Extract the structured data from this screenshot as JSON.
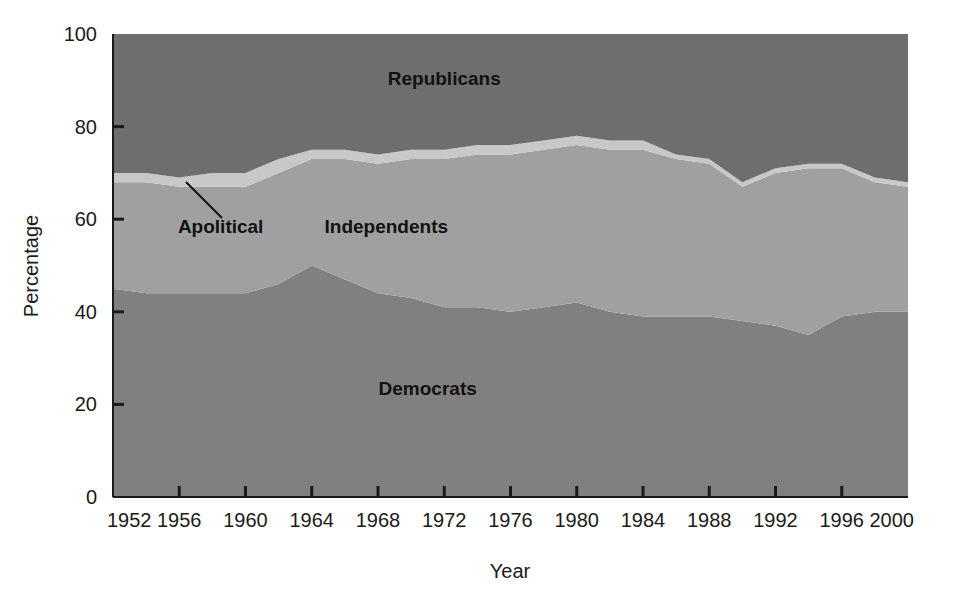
{
  "chart_data": {
    "type": "area",
    "stacked": true,
    "title": "",
    "xlabel": "Year",
    "ylabel": "Percentage",
    "xlim": [
      1952,
      2000
    ],
    "ylim": [
      0,
      100
    ],
    "grid": false,
    "legend_position": "inline-annotations",
    "x": [
      1952,
      1954,
      1956,
      1958,
      1960,
      1962,
      1964,
      1966,
      1968,
      1970,
      1972,
      1974,
      1976,
      1978,
      1980,
      1982,
      1984,
      1986,
      1988,
      1990,
      1992,
      1994,
      1996,
      1998,
      2000
    ],
    "xticks": [
      "1952",
      "1956",
      "1960",
      "1964",
      "1968",
      "1972",
      "1976",
      "1980",
      "1984",
      "1988",
      "1992",
      "1996",
      "2000"
    ],
    "yticks": [
      "0",
      "20",
      "40",
      "60",
      "80",
      "100"
    ],
    "series": [
      {
        "name": "Democrats",
        "color": "#808080",
        "values": [
          45,
          44,
          44,
          44,
          44,
          46,
          50,
          47,
          44,
          43,
          41,
          41,
          40,
          41,
          42,
          40,
          39,
          39,
          39,
          38,
          37,
          35,
          39,
          40,
          40
        ]
      },
      {
        "name": "Independents",
        "color": "#a0a0a0",
        "values": [
          23,
          24,
          23,
          23,
          23,
          24,
          23,
          26,
          28,
          30,
          32,
          33,
          34,
          34,
          34,
          35,
          36,
          34,
          33,
          29,
          33,
          36,
          32,
          28,
          27
        ]
      },
      {
        "name": "Apolitical",
        "color": "#c8c8c8",
        "values": [
          2,
          2,
          2,
          3,
          3,
          3,
          2,
          2,
          2,
          2,
          2,
          2,
          2,
          2,
          2,
          2,
          2,
          1,
          1,
          1,
          1,
          1,
          1,
          1,
          1
        ]
      },
      {
        "name": "Republicans",
        "color": "#6e6e6e",
        "values": [
          30,
          30,
          31,
          30,
          30,
          27,
          25,
          25,
          26,
          25,
          25,
          24,
          24,
          23,
          22,
          23,
          23,
          26,
          27,
          32,
          29,
          28,
          28,
          31,
          32
        ]
      }
    ],
    "annotations": [
      {
        "name": "Republicans",
        "text": "Republicans",
        "x": 1972,
        "y": 89
      },
      {
        "name": "Independents",
        "text": "Independents",
        "x": 1968.5,
        "y": 57
      },
      {
        "name": "Apolitical",
        "text": "Apolitical",
        "x": 1958.5,
        "y": 57,
        "leader_line": true
      },
      {
        "name": "Democrats",
        "text": "Democrats",
        "x": 1971,
        "y": 22
      }
    ]
  }
}
